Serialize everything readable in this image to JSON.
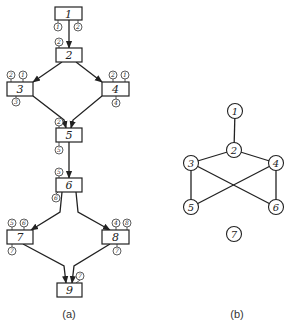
{
  "panel_a": {
    "caption": "(a)",
    "boxes": [
      {
        "id": "1",
        "label": "1",
        "x": 55,
        "y": 7,
        "w": 27,
        "h": 13
      },
      {
        "id": "2",
        "label": "2",
        "x": 56,
        "y": 48,
        "w": 26,
        "h": 14
      },
      {
        "id": "3",
        "label": "3",
        "x": 7,
        "y": 82,
        "w": 26,
        "h": 14
      },
      {
        "id": "4",
        "label": "4",
        "x": 102,
        "y": 82,
        "w": 27,
        "h": 14
      },
      {
        "id": "5",
        "label": "5",
        "x": 56,
        "y": 128,
        "w": 26,
        "h": 14
      },
      {
        "id": "6",
        "label": "6",
        "x": 56,
        "y": 178,
        "w": 26,
        "h": 14
      },
      {
        "id": "7",
        "label": "7",
        "x": 7,
        "y": 230,
        "w": 26,
        "h": 14
      },
      {
        "id": "8",
        "label": "8",
        "x": 102,
        "y": 230,
        "w": 27,
        "h": 14
      },
      {
        "id": "9",
        "label": "9",
        "x": 57,
        "y": 283,
        "w": 25,
        "h": 14
      }
    ],
    "ports": [
      {
        "box": "1",
        "label": "1",
        "cx": 58,
        "cy": 27,
        "ax": 58,
        "ay": 20
      },
      {
        "box": "1",
        "label": "2",
        "cx": 78,
        "cy": 27,
        "ax": 78,
        "ay": 20
      },
      {
        "box": "2",
        "label": "2",
        "cx": 59,
        "cy": 42,
        "ax": 59,
        "ay": 48
      },
      {
        "box": "3",
        "label": "2",
        "cx": 11,
        "cy": 75,
        "ax": 11,
        "ay": 82
      },
      {
        "box": "3",
        "label": "1",
        "cx": 23,
        "cy": 75,
        "ax": 23,
        "ay": 82
      },
      {
        "box": "3",
        "label": "3",
        "cx": 16,
        "cy": 102,
        "ax": 16,
        "ay": 96
      },
      {
        "box": "4",
        "label": "2",
        "cx": 113,
        "cy": 75,
        "ax": 113,
        "ay": 82
      },
      {
        "box": "4",
        "label": "1",
        "cx": 125,
        "cy": 75,
        "ax": 125,
        "ay": 82
      },
      {
        "box": "4",
        "label": "4",
        "cx": 116,
        "cy": 103,
        "ax": 116,
        "ay": 96
      },
      {
        "box": "5",
        "label": "2",
        "cx": 59,
        "cy": 122,
        "ax": 59,
        "ay": 128
      },
      {
        "box": "5",
        "label": "5",
        "cx": 59,
        "cy": 150,
        "ax": 59,
        "ay": 142
      },
      {
        "box": "6",
        "label": "5",
        "cx": 59,
        "cy": 172,
        "ax": 59,
        "ay": 178
      },
      {
        "box": "6",
        "label": "6",
        "cx": 56,
        "cy": 198,
        "ax": 58,
        "ay": 192
      },
      {
        "box": "7",
        "label": "5",
        "cx": 12,
        "cy": 223,
        "ax": 12,
        "ay": 230
      },
      {
        "box": "7",
        "label": "6",
        "cx": 24,
        "cy": 223,
        "ax": 24,
        "ay": 230
      },
      {
        "box": "7",
        "label": "7",
        "cx": 12,
        "cy": 251,
        "ax": 12,
        "ay": 244
      },
      {
        "box": "8",
        "label": "4",
        "cx": 116,
        "cy": 223,
        "ax": 116,
        "ay": 230
      },
      {
        "box": "8",
        "label": "8",
        "cx": 127,
        "cy": 223,
        "ax": 127,
        "ay": 230
      },
      {
        "box": "8",
        "label": "7",
        "cx": 117,
        "cy": 251,
        "ax": 117,
        "ay": 244
      },
      {
        "box": "9",
        "label": "7",
        "cx": 80,
        "cy": 276,
        "ax": 76,
        "ay": 283
      }
    ],
    "edges": [
      {
        "from": "1",
        "to": "2",
        "path": "M69 20 L69 48"
      },
      {
        "from": "2",
        "to": "3",
        "path": "M62 62 L33 82"
      },
      {
        "from": "2",
        "to": "4",
        "path": "M76 62 L102 82"
      },
      {
        "from": "3",
        "to": "5",
        "path": "M33 96 L64 120 L66 128"
      },
      {
        "from": "4",
        "to": "5",
        "path": "M102 96 L73 120 L71 128"
      },
      {
        "from": "5",
        "to": "6",
        "path": "M69 142 L69 178"
      },
      {
        "from": "6",
        "to": "7",
        "path": "M62 192 L60 212 L31 230"
      },
      {
        "from": "6",
        "to": "8",
        "path": "M76 192 L78 212 L110 230"
      },
      {
        "from": "7",
        "to": "9",
        "path": "M23 244 L64 266 L66 283"
      },
      {
        "from": "8",
        "to": "9",
        "path": "M110 244 L74 266 L72 283"
      }
    ]
  },
  "panel_b": {
    "caption": "(b)",
    "nodes": [
      {
        "id": "1",
        "label": "1",
        "cx": 235,
        "cy": 111
      },
      {
        "id": "2",
        "label": "2",
        "cx": 234,
        "cy": 150
      },
      {
        "id": "3",
        "label": "3",
        "cx": 191,
        "cy": 163
      },
      {
        "id": "4",
        "label": "4",
        "cx": 276,
        "cy": 163
      },
      {
        "id": "5",
        "label": "5",
        "cx": 191,
        "cy": 207
      },
      {
        "id": "6",
        "label": "6",
        "cx": 276,
        "cy": 207
      },
      {
        "id": "7",
        "label": "7",
        "cx": 234,
        "cy": 234
      }
    ],
    "edges": [
      {
        "from": "1",
        "to": "2"
      },
      {
        "from": "2",
        "to": "3"
      },
      {
        "from": "2",
        "to": "4"
      },
      {
        "from": "3",
        "to": "5"
      },
      {
        "from": "3",
        "to": "6"
      },
      {
        "from": "4",
        "to": "5"
      },
      {
        "from": "4",
        "to": "6"
      }
    ]
  }
}
